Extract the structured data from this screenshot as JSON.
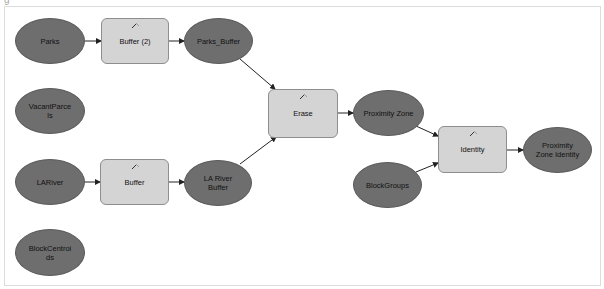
{
  "diagram": {
    "corner_glyph": "g",
    "colors": {
      "data_fill": "#6e6e6e",
      "process_fill": "#d4d4d4",
      "process_border": "#8e8e8e",
      "edge": "#222222",
      "frame": "#dcdcdc"
    },
    "nodes": {
      "parks": {
        "label": "Parks",
        "type": "data"
      },
      "vacant_parcels": {
        "label": "VacantParce\nls",
        "type": "data"
      },
      "la_river": {
        "label": "LARiver",
        "type": "data"
      },
      "block_centroids": {
        "label": "BlockCentroi\nds",
        "type": "data"
      },
      "buffer2": {
        "label": "Buffer (2)",
        "type": "process",
        "icon": "hammer-icon"
      },
      "buffer": {
        "label": "Buffer",
        "type": "process",
        "icon": "hammer-icon"
      },
      "parks_buffer": {
        "label": "Parks_Buffer",
        "type": "data"
      },
      "la_river_buffer": {
        "label": "LA River\nBuffer",
        "type": "data"
      },
      "erase": {
        "label": "Erase",
        "type": "process",
        "icon": "hammer-icon"
      },
      "proximity_zone": {
        "label": "Proximity Zone",
        "type": "data"
      },
      "block_groups": {
        "label": "BlockGroups",
        "type": "data"
      },
      "identity": {
        "label": "Identity",
        "type": "process",
        "icon": "hammer-icon"
      },
      "proximity_zone_identity": {
        "label": "Proximity\nZone Identity",
        "type": "data"
      }
    },
    "edges": [
      {
        "from": "Parks",
        "to": "Buffer (2)"
      },
      {
        "from": "Buffer (2)",
        "to": "Parks_Buffer"
      },
      {
        "from": "LARiver",
        "to": "Buffer"
      },
      {
        "from": "Buffer",
        "to": "LA River Buffer"
      },
      {
        "from": "Parks_Buffer",
        "to": "Erase"
      },
      {
        "from": "LA River Buffer",
        "to": "Erase"
      },
      {
        "from": "Erase",
        "to": "Proximity Zone"
      },
      {
        "from": "Proximity Zone",
        "to": "Identity"
      },
      {
        "from": "BlockGroups",
        "to": "Identity"
      },
      {
        "from": "Identity",
        "to": "Proximity Zone Identity"
      }
    ]
  }
}
